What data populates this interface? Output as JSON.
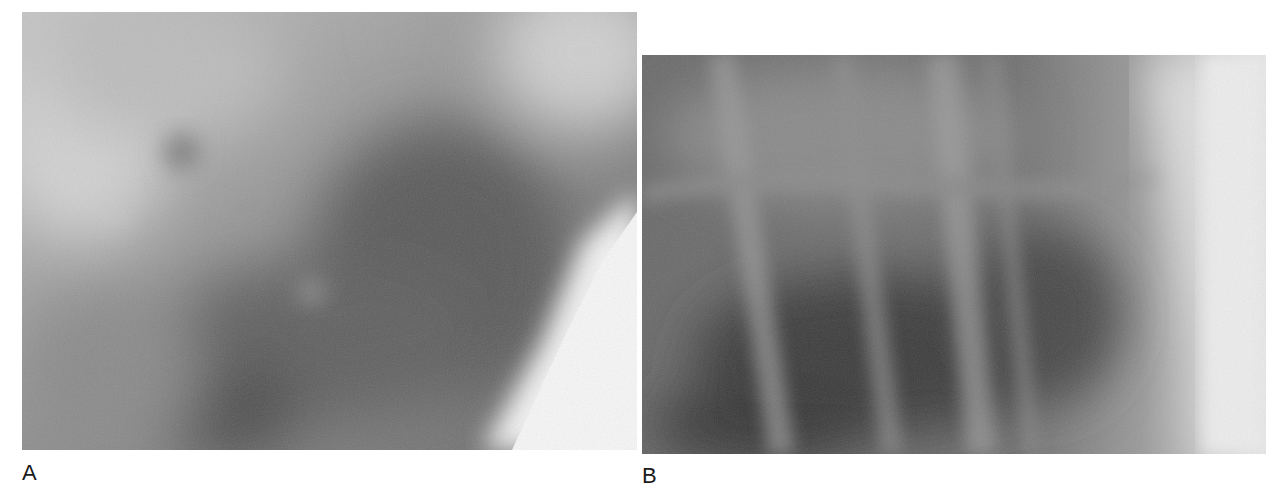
{
  "figure": {
    "panels": [
      {
        "id": "A",
        "label": "A",
        "description": "Radiograph close-up of lung tissue, grayscale, with a dark central area and a bright lower-right region"
      },
      {
        "id": "B",
        "label": "B",
        "description": "Radiograph close-up showing rib shadows over lung tissue, grayscale, with a bright soft-tissue band on the right"
      }
    ],
    "colors": {
      "background": "#ffffff",
      "label_text": "#1a1a1a",
      "panel_a_mid": "#9a9a9a",
      "panel_b_mid": "#6e6e6e"
    }
  }
}
